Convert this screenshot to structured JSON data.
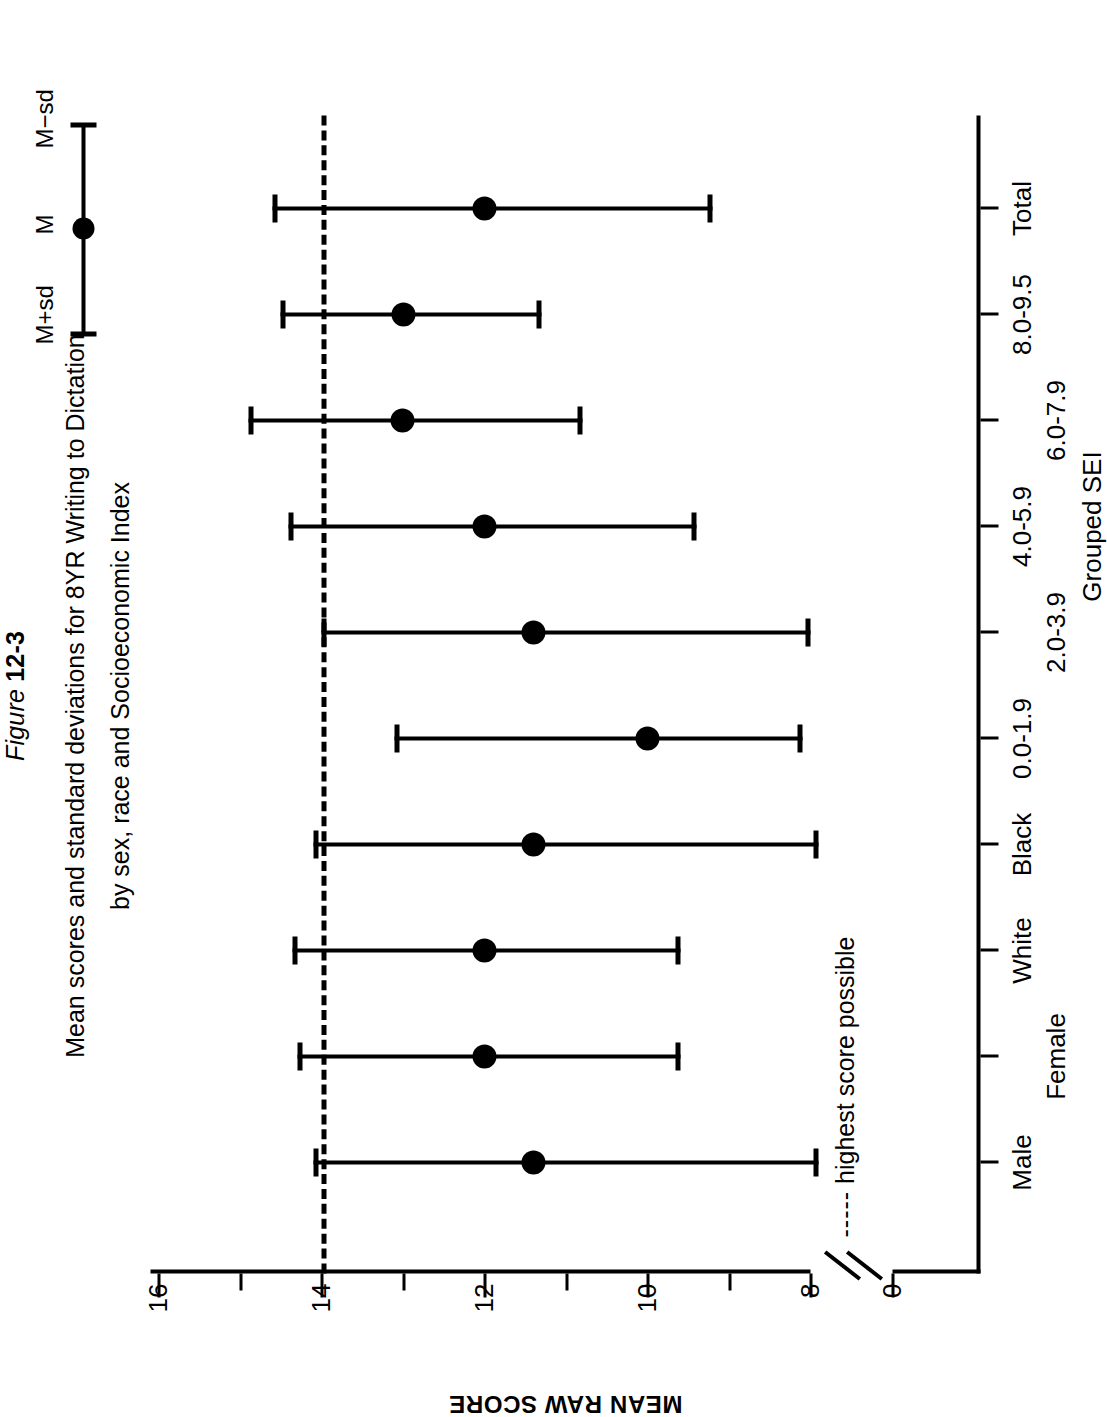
{
  "figure": {
    "number_prefix": "Figure ",
    "number": "12-3",
    "title_line1": "Mean scores and standard deviations for 8YR Writing to Dictation",
    "title_line2": "by sex, race and Socioeconomic Index"
  },
  "legend": {
    "upper_label": "M+sd",
    "mean_label": "M",
    "lower_label": "M−sd"
  },
  "annotation": {
    "dashes": "-----",
    "text": " highest score possible"
  },
  "axes": {
    "y_title": "MEAN RAW SCORE",
    "y_ticks_labeled": [
      "16",
      "14",
      "12",
      "10",
      "8",
      "0"
    ],
    "x_group_label": "Grouped SEI"
  },
  "chart_data": {
    "type": "scatter",
    "title": "Mean scores and standard deviations for 8YR Writing to Dictation by sex, race and Socioeconomic Index",
    "xlabel": "Grouped SEI",
    "ylabel": "MEAN RAW SCORE",
    "ylim": [
      0,
      16
    ],
    "y_ticks": [
      0,
      8,
      9,
      10,
      11,
      12,
      13,
      14,
      15,
      16
    ],
    "y_ticks_labeled": [
      16,
      14,
      12,
      10,
      8,
      0
    ],
    "y_axis_break": "between 0 and 8",
    "grid": false,
    "legend_position": "top-right",
    "reference_line": {
      "value": 14,
      "style": "dashed",
      "label": "highest score possible"
    },
    "categories": [
      "Male",
      "Female",
      "White",
      "Black",
      "0.0-1.9",
      "2.0-3.9",
      "4.0-5.9",
      "6.0-7.9",
      "8.0-9.5",
      "Total"
    ],
    "category_groups": [
      {
        "name": "Sex",
        "members": [
          "Male",
          "Female"
        ]
      },
      {
        "name": "Race",
        "members": [
          "White",
          "Black"
        ]
      },
      {
        "name": "Grouped SEI",
        "members": [
          "0.0-1.9",
          "2.0-3.9",
          "4.0-5.9",
          "6.0-7.9",
          "8.0-9.5"
        ]
      },
      {
        "name": "Overall",
        "members": [
          "Total"
        ]
      }
    ],
    "series": [
      {
        "name": "M",
        "values": [
          11.4,
          12.0,
          12.0,
          11.4,
          10.0,
          11.4,
          12.0,
          13.0,
          13.0,
          12.0
        ]
      },
      {
        "name": "M+sd",
        "values": [
          14.1,
          14.3,
          14.35,
          14.1,
          13.1,
          14.0,
          14.4,
          14.9,
          14.5,
          14.6
        ]
      },
      {
        "name": "M-sd",
        "values": [
          7.9,
          9.6,
          9.6,
          7.9,
          8.1,
          8.0,
          9.4,
          10.8,
          11.3,
          9.2
        ]
      }
    ],
    "points": [
      {
        "category": "Male",
        "mean": 11.4,
        "upper": 14.1,
        "lower": 7.9
      },
      {
        "category": "Female",
        "mean": 12.0,
        "upper": 14.3,
        "lower": 9.6
      },
      {
        "category": "White",
        "mean": 12.0,
        "upper": 14.35,
        "lower": 9.6
      },
      {
        "category": "Black",
        "mean": 11.4,
        "upper": 14.1,
        "lower": 7.9
      },
      {
        "category": "0.0-1.9",
        "mean": 10.0,
        "upper": 13.1,
        "lower": 8.1
      },
      {
        "category": "2.0-3.9",
        "mean": 11.4,
        "upper": 14.0,
        "lower": 8.0
      },
      {
        "category": "4.0-5.9",
        "mean": 12.0,
        "upper": 14.4,
        "lower": 9.4
      },
      {
        "category": "6.0-7.9",
        "mean": 13.0,
        "upper": 14.9,
        "lower": 10.8
      },
      {
        "category": "8.0-9.5",
        "mean": 13.0,
        "upper": 14.5,
        "lower": 11.3
      },
      {
        "category": "Total",
        "mean": 12.0,
        "upper": 14.6,
        "lower": 9.2
      }
    ]
  }
}
